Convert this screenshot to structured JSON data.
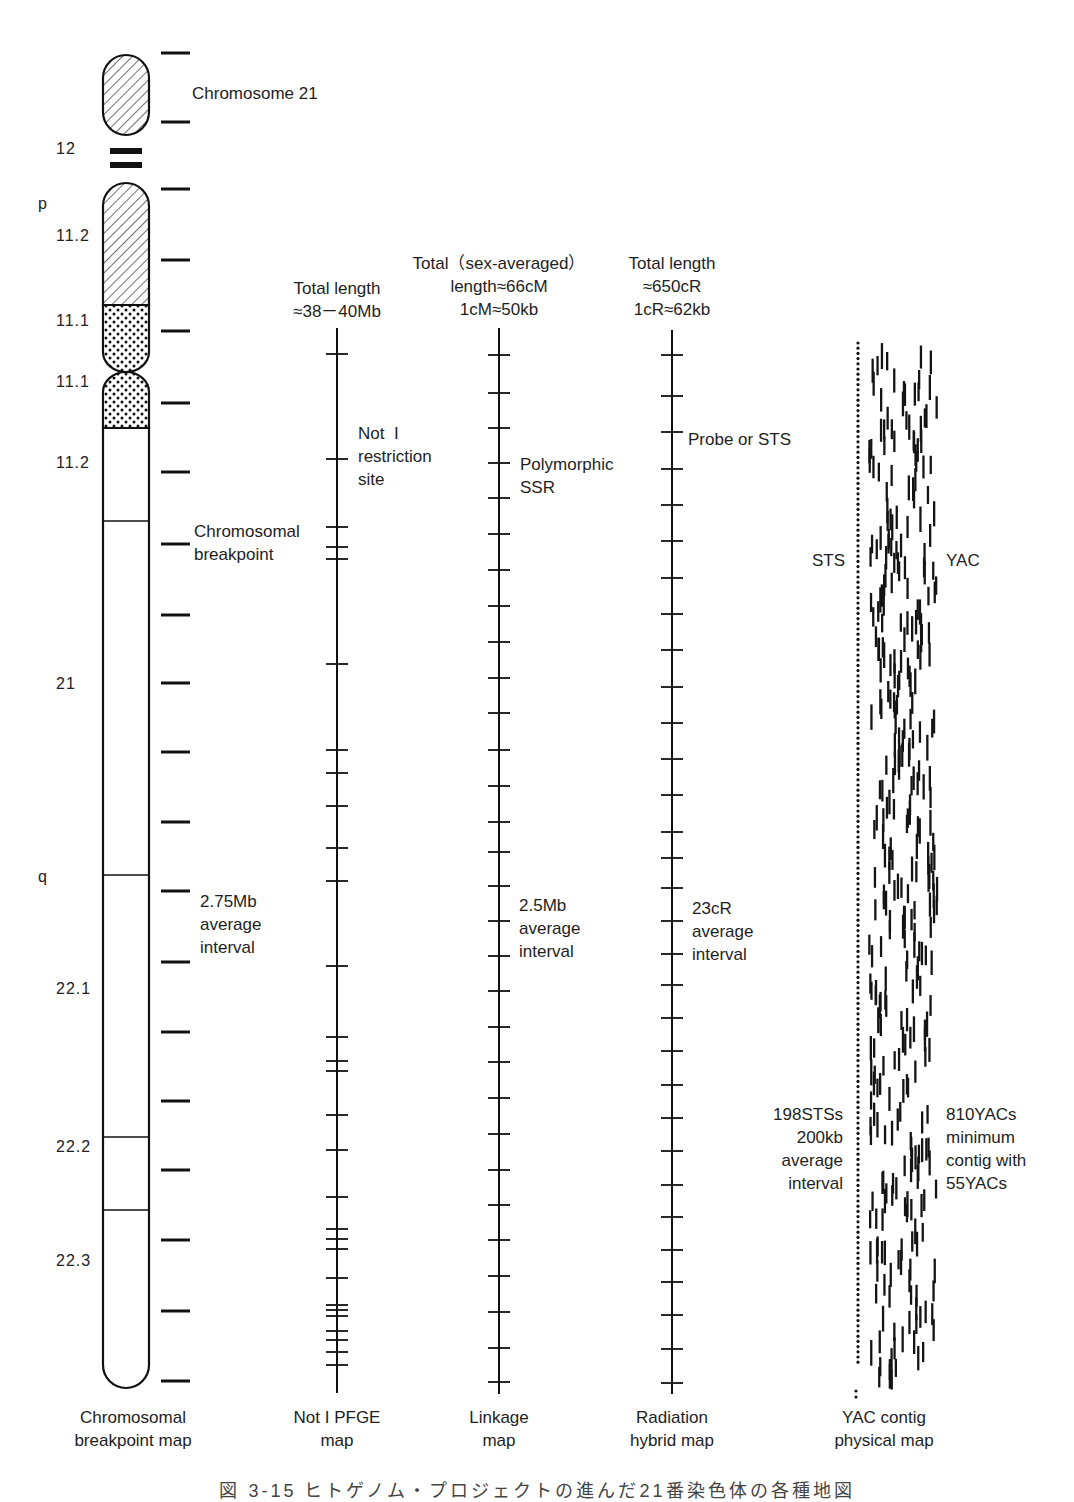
{
  "figure": {
    "caption": "図 3-15 ヒトゲノム・プロジェクトの進んだ21番染色体の各種地図",
    "chromosome_title": "Chromosome 21",
    "arm_labels": [
      {
        "text": "p",
        "x": 38,
        "y": 205
      },
      {
        "text": "q",
        "x": 38,
        "y": 878
      }
    ],
    "band_labels": [
      {
        "text": "12",
        "x": 56,
        "y": 150
      },
      {
        "text": "11.2",
        "x": 56,
        "y": 237
      },
      {
        "text": "11.1",
        "x": 56,
        "y": 322
      },
      {
        "text": "11.1",
        "x": 56,
        "y": 383
      },
      {
        "text": "11.2",
        "x": 56,
        "y": 464
      },
      {
        "text": "21",
        "x": 56,
        "y": 685
      },
      {
        "text": "22.1",
        "x": 56,
        "y": 990
      },
      {
        "text": "22.2",
        "x": 56,
        "y": 1148
      },
      {
        "text": "22.3",
        "x": 56,
        "y": 1262
      }
    ],
    "band_boundaries_y": [
      521,
      875,
      1137,
      1210
    ],
    "maps": [
      {
        "id": "breakpoint",
        "bottom_label": "Chromosomal\nbreakpoint map",
        "label_x": 133,
        "annotations": [
          {
            "text": "Chromosomal\nbreakpoint",
            "x": 194,
            "y": 520
          },
          {
            "text": "2.75Mb\naverage\ninterval",
            "x": 200,
            "y": 890
          }
        ],
        "ticks_y": [
          53,
          122,
          189,
          260,
          331,
          403,
          472,
          544,
          615,
          683,
          752,
          822,
          891,
          962,
          1032,
          1101,
          1170,
          1240,
          1311,
          1381
        ]
      },
      {
        "id": "noti-pfge",
        "header": "Total length\n≈38－40Mb",
        "header_x": 337,
        "header_y": 277,
        "bottom_label": "Not I PFGE\nmap",
        "label_x": 337,
        "axis_x": 337,
        "axis_top": 328,
        "axis_bottom": 1393,
        "annotations": [
          {
            "text": "Not  I\nrestriction\nsite",
            "x": 358,
            "y": 422
          }
        ],
        "ticks_y": [
          354,
          459,
          527,
          547,
          559,
          664,
          750,
          773,
          806,
          848,
          881,
          966,
          1037,
          1061,
          1071,
          1115,
          1150,
          1197,
          1229,
          1239,
          1249,
          1278,
          1305,
          1310,
          1316,
          1331,
          1340,
          1352,
          1365
        ]
      },
      {
        "id": "linkage",
        "header": "Total（sex-averaged）\nlength≈66cM\n1cM≈50kb",
        "header_x": 499,
        "header_y": 252,
        "bottom_label": "Linkage\nmap",
        "label_x": 499,
        "axis_x": 499,
        "axis_top": 328,
        "axis_bottom": 1394,
        "annotations": [
          {
            "text": "Polymorphic\nSSR",
            "x": 520,
            "y": 453
          },
          {
            "text": "2.5Mb\naverage\ninterval",
            "x": 519,
            "y": 894
          }
        ],
        "ticks_y": [
          355,
          393,
          428,
          463,
          498,
          534,
          570,
          606,
          642,
          678,
          713,
          750,
          786,
          822,
          852,
          886,
          921,
          956,
          991,
          1027,
          1062,
          1098,
          1134,
          1170,
          1205,
          1240,
          1276,
          1312,
          1348,
          1382
        ]
      },
      {
        "id": "radiation-hybrid",
        "header": "Total length\n≈650cR\n1cR≈62kb",
        "header_x": 672,
        "header_y": 252,
        "bottom_label": "Radiation\nhybrid map",
        "label_x": 672,
        "axis_x": 672,
        "axis_top": 330,
        "axis_bottom": 1394,
        "annotations": [
          {
            "text": "Probe or STS",
            "x": 688,
            "y": 428
          },
          {
            "text": "23cR\naverage\ninterval",
            "x": 692,
            "y": 897
          }
        ],
        "ticks_y": [
          355,
          396,
          432,
          469,
          505,
          541,
          578,
          614,
          650,
          687,
          723,
          759,
          795,
          832,
          858,
          888,
          921,
          954,
          985,
          1018,
          1051,
          1085,
          1118,
          1151,
          1185,
          1217,
          1250,
          1282,
          1315,
          1349,
          1383
        ]
      },
      {
        "id": "yac-contig",
        "bottom_label": "YAC contig\nphysical map",
        "label_x": 884,
        "sts_label": "STS",
        "yac_label": "YAC",
        "sts_stats": "198STSs\n200kb\naverage\ninterval",
        "yac_stats": "810YACs\nminimum\ncontig with\n55YACs",
        "sts_line_x": 858,
        "sts_top": 343,
        "sts_bottom": 1363,
        "yac_band": {
          "x_min": 868,
          "x_max": 936,
          "y_top": 338,
          "y_bottom": 1392,
          "rows": 120,
          "dash_len": 22,
          "seed": 21
        }
      }
    ]
  }
}
